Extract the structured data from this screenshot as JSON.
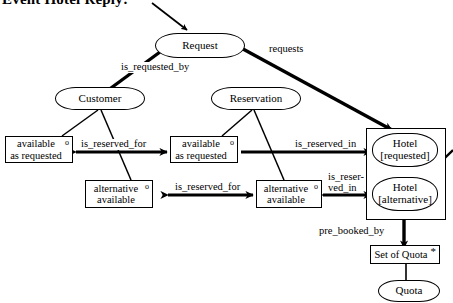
{
  "diagram": {
    "title": "Event Hotel Reply:",
    "type": "entity-relationship-object-diagram",
    "nodes": [
      {
        "id": "request",
        "label": "Request",
        "shape": "rounded"
      },
      {
        "id": "customer",
        "label": "Customer",
        "shape": "rounded"
      },
      {
        "id": "reservation",
        "label": "Reservation",
        "shape": "rounded"
      },
      {
        "id": "avail-left",
        "label": "available\nas requested",
        "shape": "rect",
        "marker": "o"
      },
      {
        "id": "avail-right",
        "label": "available\nas requested",
        "shape": "rect",
        "marker": "o"
      },
      {
        "id": "alt-left",
        "label": "alternative\navailable",
        "shape": "rect",
        "marker": "o"
      },
      {
        "id": "alt-right",
        "label": "alternative\navailable",
        "shape": "rect",
        "marker": "o"
      },
      {
        "id": "hotel-requested",
        "label": "Hotel\n[requested]",
        "shape": "rounded"
      },
      {
        "id": "hotel-alternative",
        "label": "Hotel\n[alternative]",
        "shape": "rounded"
      },
      {
        "id": "set-of-quota",
        "label": "Set of Quota",
        "shape": "rect",
        "marker": "*"
      },
      {
        "id": "quota",
        "label": "Quota",
        "shape": "rounded"
      }
    ],
    "labels": {
      "title": "Event Hotel Reply:",
      "request": "Request",
      "customer": "Customer",
      "reservation": "Reservation",
      "available_line1": "available",
      "available_line2": "as requested",
      "alternative_line1": "alternative",
      "alternative_line2": "available",
      "hotel_requested_line1": "Hotel",
      "hotel_requested_line2": "[requested]",
      "hotel_alternative_line1": "Hotel",
      "hotel_alternative_line2": "[alternative]",
      "set_of_quota": "Set of Quota",
      "quota": "Quota",
      "marker_optional": "o",
      "marker_multiple": "*"
    },
    "edges": [
      {
        "id": "e1",
        "label": "is_requested_by",
        "from": "request",
        "to": "customer",
        "style": "thick-bidirectional"
      },
      {
        "id": "e2",
        "label": "requests",
        "from": "hotel",
        "to": "request",
        "style": "thick-bidirectional"
      },
      {
        "id": "e3",
        "label": "is_reserved_for",
        "from": "avail-left",
        "to": "avail-right",
        "style": "thick-bidirectional"
      },
      {
        "id": "e4",
        "label": "is_reserved_for",
        "from": "alt-left",
        "to": "alt-right",
        "style": "thick-bidirectional"
      },
      {
        "id": "e5",
        "label": "is_reserved_in",
        "from": "avail-right",
        "to": "hotel-requested",
        "style": "thick-arrow"
      },
      {
        "id": "e6",
        "label": "is_reser-\nved_in",
        "from": "alt-right",
        "to": "hotel-alternative",
        "style": "thick-bidirectional"
      },
      {
        "id": "e7",
        "label": "pre_booked_by",
        "from": "hotel-alternative",
        "to": "set-of-quota",
        "style": "thick-bidirectional"
      },
      {
        "id": "e8",
        "label": "",
        "from": "set-of-quota",
        "to": "quota",
        "style": "thin-line"
      }
    ],
    "edge_labels": {
      "is_requested_by": "is_requested_by",
      "requests": "requests",
      "is_reserved_for_top": "is_reserved_for",
      "is_reserved_for_bottom": "is_reserved_for",
      "is_reserved_in": "is_reserved_in",
      "is_reserved_in_wrapped_line1": "is_reser-",
      "is_reserved_in_wrapped_line2": "ved_in",
      "pre_booked_by": "pre_booked_by"
    },
    "colors": {
      "stroke": "#000000",
      "background": "#ffffff",
      "text": "#000000"
    }
  }
}
